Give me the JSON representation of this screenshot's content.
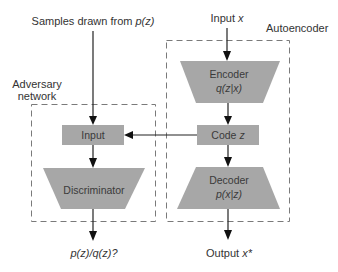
{
  "diagram": {
    "type": "adversarial-autoencoder",
    "groups": {
      "adversary": {
        "label_line1": "Adversary",
        "label_line2": "network"
      },
      "autoencoder": {
        "label": "Autoencoder"
      }
    },
    "inputs": {
      "samples": {
        "prefix": "Samples drawn from ",
        "math": "p(z)"
      },
      "input_x": {
        "prefix": "Input ",
        "math": "x"
      }
    },
    "nodes": {
      "encoder": {
        "title": "Encoder",
        "math": "q(z|x)"
      },
      "code": {
        "prefix": "Code ",
        "math": "z"
      },
      "decoder": {
        "title": "Decoder",
        "math": "p(x|z)"
      },
      "disc_input": {
        "title": "Input"
      },
      "discriminator": {
        "title": "Discriminator"
      }
    },
    "outputs": {
      "ratio": {
        "math": "p(z)/q(z)?"
      },
      "output_x": {
        "prefix": "Output ",
        "math": "x*"
      }
    },
    "edges": [
      {
        "from": "samples",
        "to": "disc_input"
      },
      {
        "from": "input_x",
        "to": "encoder"
      },
      {
        "from": "encoder",
        "to": "code"
      },
      {
        "from": "code",
        "to": "decoder"
      },
      {
        "from": "code",
        "to": "disc_input"
      },
      {
        "from": "disc_input",
        "to": "discriminator"
      },
      {
        "from": "discriminator",
        "to": "ratio"
      },
      {
        "from": "decoder",
        "to": "output_x"
      }
    ],
    "colors": {
      "node_fill": "#a7a7a7",
      "edge": "#222222",
      "group_border": "#7a7a7a",
      "text": "#333333"
    }
  }
}
